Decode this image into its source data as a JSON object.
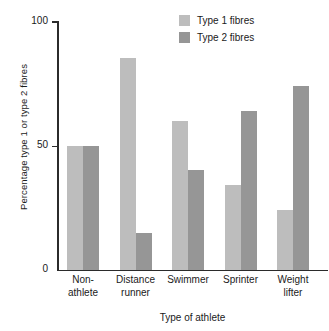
{
  "chart_data": {
    "type": "bar",
    "title": "",
    "subtitle": "",
    "xlabel": "Type of athlete",
    "ylabel": "Percentage type 1 or type 2 fibres",
    "categories": [
      "Non-\nathlete",
      "Distance\nrunner",
      "Swimmer",
      "Sprinter",
      "Weight\nlifter"
    ],
    "series": [
      {
        "name": "Type 1 fibres",
        "color": "#bdbdbd",
        "values": [
          50,
          85,
          60,
          34,
          24
        ]
      },
      {
        "name": "Type 2 fibres",
        "color": "#969696",
        "values": [
          50,
          15,
          40,
          64,
          74
        ]
      }
    ],
    "ylim": [
      0,
      100
    ],
    "yticks": [
      0,
      50,
      100
    ],
    "ytick_labels": [
      "0",
      "50",
      "100"
    ],
    "grid": false,
    "legend_position": "top-right"
  },
  "axis": {
    "y_title": "Percentage type 1 or type 2 fibres",
    "x_title": "Type of athlete",
    "tick_100": "100",
    "tick_50": "50",
    "tick_0": "0"
  },
  "legend": {
    "items": [
      {
        "label": "Type 1 fibres",
        "color": "#bdbdbd"
      },
      {
        "label": "Type 2 fibres",
        "color": "#969696"
      }
    ]
  },
  "categories": [
    {
      "label": "Non-\nathlete"
    },
    {
      "label": "Distance\nrunner"
    },
    {
      "label": "Swimmer"
    },
    {
      "label": "Sprinter"
    },
    {
      "label": "Weight\nlifter"
    }
  ]
}
